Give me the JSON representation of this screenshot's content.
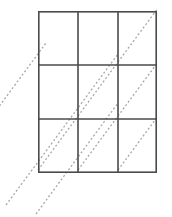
{
  "figure": {
    "title": "",
    "caption": "",
    "type": "geometric-diagram",
    "canvas": {
      "width": 172,
      "height": 217,
      "background": "#ffffff"
    },
    "grid": {
      "label": "",
      "rows": 3,
      "columns": 3,
      "x_left": 38,
      "x_right": 157,
      "y_top": 11,
      "y_bottom": 173,
      "vertical_lines_x": [
        38,
        78,
        118,
        157
      ],
      "horizontal_lines_y": [
        11,
        65,
        119,
        173
      ],
      "cell_width": 40,
      "cell_height": 54,
      "stroke_color": "#4a4a4a",
      "stroke_width": 1.6
    },
    "diagonals": {
      "label": "",
      "count": 6,
      "slope": -1.35,
      "direction": "lower-left to upper-right",
      "stroke_color": "#a8a8a8",
      "stroke_width": 1.3,
      "dash_pattern": "2 2.2",
      "lines": [
        {
          "x1": -8,
          "y1": 116,
          "x2": 46,
          "y2": 43
        },
        {
          "x1": 6,
          "y1": 205,
          "x2": 118,
          "y2": 54
        },
        {
          "x1": 36,
          "y1": 214,
          "x2": 118,
          "y2": 103
        },
        {
          "x1": 38,
          "y1": 170,
          "x2": 158,
          "y2": 8
        },
        {
          "x1": 78,
          "y1": 170,
          "x2": 158,
          "y2": 62
        },
        {
          "x1": 118,
          "y1": 170,
          "x2": 158,
          "y2": 116
        }
      ],
      "segments": [
        {
          "from_cell": "r3c1",
          "to_cell": "r1c1"
        },
        {
          "from_cell": "r3c2",
          "to_cell": "r1c2"
        },
        {
          "from_cell": "r3c3",
          "to_cell": "r1c3"
        }
      ]
    },
    "cells": [
      {
        "row": 1,
        "column": 1,
        "name": "cell-r1c1",
        "has_diagonal": true
      },
      {
        "row": 1,
        "column": 2,
        "name": "cell-r1c2",
        "has_diagonal": true
      },
      {
        "row": 1,
        "column": 3,
        "name": "cell-r1c3",
        "has_diagonal": true
      },
      {
        "row": 2,
        "column": 1,
        "name": "cell-r2c1",
        "has_diagonal": true
      },
      {
        "row": 2,
        "column": 2,
        "name": "cell-r2c2",
        "has_diagonal": true
      },
      {
        "row": 2,
        "column": 3,
        "name": "cell-r2c3",
        "has_diagonal": true
      },
      {
        "row": 3,
        "column": 1,
        "name": "cell-r3c1",
        "has_diagonal": true
      },
      {
        "row": 3,
        "column": 2,
        "name": "cell-r3c2",
        "has_diagonal": true
      },
      {
        "row": 3,
        "column": 3,
        "name": "cell-r3c3",
        "has_diagonal": true
      }
    ]
  }
}
